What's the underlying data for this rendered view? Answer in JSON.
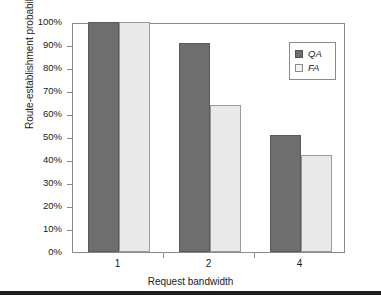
{
  "chart_data": {
    "type": "bar",
    "title": "",
    "xlabel": "Request bandwidth",
    "ylabel": "Route-establishment probability",
    "categories": [
      "1",
      "2",
      "4"
    ],
    "series": [
      {
        "name": "QA",
        "values": [
          100,
          91,
          51
        ],
        "color": "#6e6e6e"
      },
      {
        "name": "FA",
        "values": [
          100,
          64,
          42
        ],
        "color": "#e9e9e9"
      }
    ],
    "ylim": [
      0,
      100
    ],
    "y_tick_labels": [
      "0%",
      "10%",
      "20%",
      "30%",
      "40%",
      "50%",
      "60%",
      "70%",
      "80%",
      "90%",
      "100%"
    ],
    "y_tick_values": [
      0,
      10,
      20,
      30,
      40,
      50,
      60,
      70,
      80,
      90,
      100
    ],
    "grid": false,
    "legend_position": "top-right",
    "legend_entries": [
      "QA",
      "FA"
    ],
    "value_suffix": "%"
  }
}
